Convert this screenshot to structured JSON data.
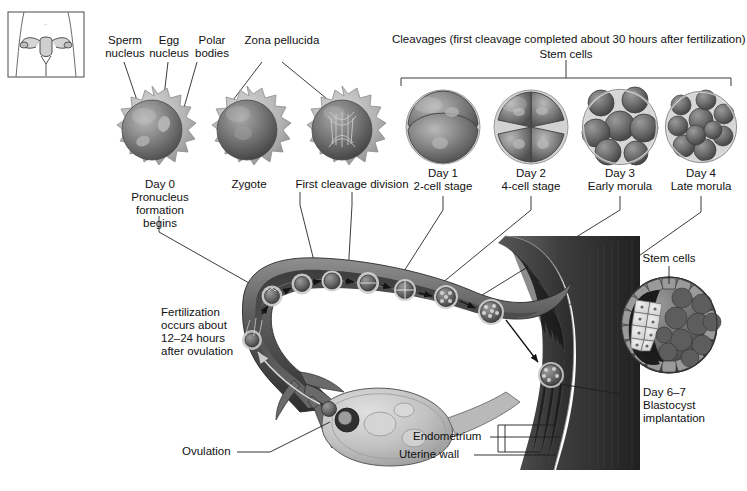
{
  "figure": {
    "title_region": "human fertilization and preimplantation development diagram",
    "inset": {
      "name": "female-pelvis-inset",
      "description": "torso outline with uterus and fallopian tubes"
    }
  },
  "top_labels": {
    "sperm_nucleus": "Sperm\nnucleus",
    "egg_nucleus": "Egg\nnucleus",
    "polar_bodies": "Polar\nbodies",
    "zona_pellucida": "Zona pellucida",
    "cleavages": "Cleavages (first cleavage completed about 30 hours after fertilization)",
    "stem_cells_top": "Stem cells"
  },
  "stage_labels": [
    {
      "id": "day0",
      "text": "Day 0\nPronucleus\nformation\nbegins"
    },
    {
      "id": "zygote",
      "text": "Zygote"
    },
    {
      "id": "first-cleavage",
      "text": "First cleavage division"
    },
    {
      "id": "day1",
      "text": "Day 1\n2-cell stage"
    },
    {
      "id": "day2",
      "text": "Day 2\n4-cell stage"
    },
    {
      "id": "day3",
      "text": "Day 3\nEarly morula"
    },
    {
      "id": "day4",
      "text": "Day 4\nLate morula"
    }
  ],
  "annotations": {
    "fertilization": "Fertilization\noccurs about\n12–24 hours\nafter ovulation",
    "ovulation": "Ovulation",
    "endometrium": "Endometrium",
    "uterine_wall": "Uterine wall",
    "stem_cells_right": "Stem cells",
    "blastocyst": "Day 6–7\nBlastocyst\nimplantation"
  },
  "colors": {
    "ink": "#1a1a1a",
    "leader": "#2b2b2b",
    "cell_dark": "#555555",
    "cell_mid": "#8d8d8d",
    "cell_light": "#c9c9c9",
    "corona": "#b5b5b5",
    "tube_dark": "#4a4a4a",
    "tube_mid": "#7d7d7d",
    "uterus_wall": "#3d3d3d",
    "ovary": "#c4c4c4",
    "background": "#ffffff"
  }
}
